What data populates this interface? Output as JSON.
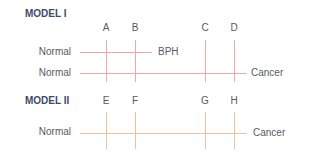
{
  "colors": {
    "model1_line": "#f0a8a0",
    "model2_line": "#f2c0a0"
  },
  "model1": {
    "title": "MODEL I",
    "letters": [
      "A",
      "B",
      "C",
      "D"
    ],
    "rows": [
      {
        "start": "Normal",
        "end": "BPH"
      },
      {
        "start": "Normal",
        "end": "Cancer"
      }
    ]
  },
  "model2": {
    "title": "MODEL II",
    "letters": [
      "E",
      "F",
      "G",
      "H"
    ],
    "rows": [
      {
        "start": "Normal",
        "end": "Cancer"
      }
    ]
  }
}
